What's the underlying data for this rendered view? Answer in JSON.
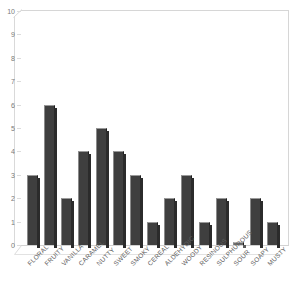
{
  "chart_data": {
    "type": "bar",
    "title": "",
    "clipped_title_text": "aroma profile",
    "xlabel": "",
    "ylabel": "",
    "ylim": [
      0,
      10
    ],
    "ytick_labels": [
      "0",
      "1",
      "2",
      "3",
      "4",
      "5",
      "6",
      "7",
      "8",
      "9",
      "10"
    ],
    "ytick_values": [
      0,
      1,
      2,
      3,
      4,
      5,
      6,
      7,
      8,
      9,
      10
    ],
    "grid": false,
    "legend": null,
    "bar_color": "#3f3f3f",
    "plot_background": "#ffffff",
    "axis_color": "#d6d6d6",
    "categories": [
      "FLORAL",
      "FRUITY",
      "VANILLA",
      "CARAMEL",
      "NUTTY",
      "SWEET",
      "SMOKY",
      "CEREAL",
      "ALDEHYDIC",
      "WOODY",
      "RESINOUS",
      "SULPHUROUS",
      "SOUR",
      "SOAPY",
      "MUSTY"
    ],
    "values": [
      3,
      6,
      2,
      4,
      5,
      4,
      3,
      1,
      2,
      3,
      1,
      2,
      0,
      2,
      1
    ]
  }
}
